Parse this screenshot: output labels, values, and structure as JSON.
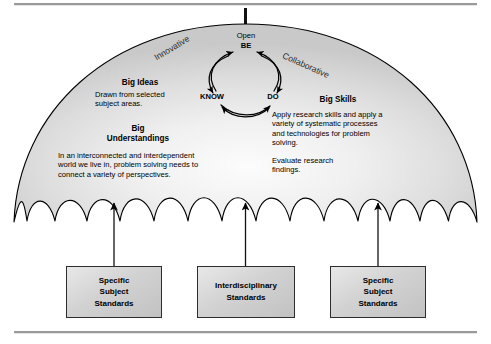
{
  "diagram": {
    "background_color": "#ffffff",
    "rule_color": "#9a9a9a",
    "canopy": {
      "fill_center": "#fafafa",
      "fill_edge": "#cfcfcf",
      "outline_color": "#000000"
    }
  },
  "arc_labels": {
    "left": "Innovative",
    "right": "Collaborative"
  },
  "cycle": {
    "open_label": "Open",
    "be_label": "BE",
    "know_label": "KNOW",
    "do_label": "DO"
  },
  "blocks": {
    "big_ideas": {
      "heading": "Big Ideas",
      "body": "Drawn from selected\nsubject areas."
    },
    "big_understandings": {
      "heading": "Big\nUnderstandings",
      "body": "In an interconnected and interdependent\nworld we live in, problem solving needs to\nconnect a variety of perspectives."
    },
    "big_skills": {
      "heading": "Big Skills",
      "body_1": "Apply research skills and apply a\nvariety of systematic processes\nand technologies for problem\nsolving.",
      "body_2": "Evaluate research\nfindings."
    }
  },
  "standards_boxes": [
    {
      "label": "Specific\nSubject\nStandards"
    },
    {
      "label": "Interdisciplinary\nStandards"
    },
    {
      "label": "Specific\nSubject\nStandards"
    }
  ]
}
